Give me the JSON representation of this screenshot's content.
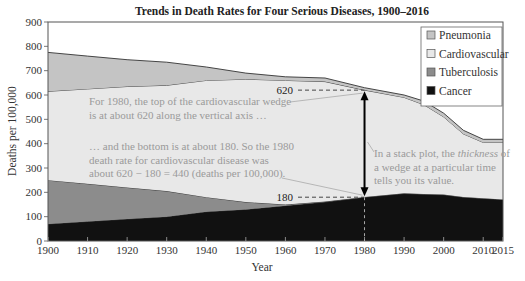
{
  "chart_data": {
    "type": "area",
    "stacked": true,
    "title": "Trends in Death Rates for Four Serious Diseases, 1900–2016",
    "xlabel": "Year",
    "ylabel": "Deaths per 100,000",
    "xlim": [
      1900,
      2015
    ],
    "ylim": [
      0,
      900
    ],
    "x_ticks": [
      "1900",
      "1910",
      "1920",
      "1930",
      "1940",
      "1950",
      "1960",
      "1970",
      "1980",
      "1990",
      "2000",
      "2010",
      "2015"
    ],
    "y_ticks": [
      "0",
      "100",
      "200",
      "300",
      "400",
      "500",
      "600",
      "700",
      "800",
      "900"
    ],
    "grid": false,
    "legend_position": "top-right",
    "x": [
      1900,
      1910,
      1920,
      1930,
      1940,
      1950,
      1960,
      1970,
      1980,
      1990,
      1995,
      2000,
      2005,
      2010,
      2015
    ],
    "cumulative_tops": {
      "Cancer": [
        70,
        80,
        90,
        100,
        120,
        130,
        145,
        160,
        180,
        195,
        192,
        190,
        180,
        175,
        170
      ],
      "Tuberculosis": [
        250,
        235,
        220,
        205,
        180,
        160,
        150,
        162,
        181,
        196,
        193,
        191,
        181,
        176,
        171
      ],
      "Cardiovascular": [
        615,
        625,
        635,
        640,
        660,
        665,
        660,
        655,
        620,
        590,
        560,
        510,
        440,
        405,
        405
      ],
      "Pneumonia": [
        775,
        760,
        745,
        735,
        715,
        690,
        675,
        670,
        630,
        600,
        575,
        525,
        455,
        418,
        418
      ]
    },
    "series": [
      {
        "name": "Cancer",
        "color": "#111111",
        "values": [
          70,
          80,
          90,
          100,
          120,
          130,
          145,
          160,
          180,
          195,
          192,
          190,
          180,
          175,
          170
        ]
      },
      {
        "name": "Tuberculosis",
        "color": "#8c8c8c",
        "values": [
          180,
          155,
          130,
          105,
          60,
          30,
          5,
          2,
          1,
          1,
          1,
          1,
          1,
          1,
          1
        ]
      },
      {
        "name": "Cardiovascular",
        "color": "#e8e8e8",
        "values": [
          365,
          390,
          415,
          435,
          480,
          505,
          510,
          493,
          439,
          394,
          367,
          319,
          259,
          229,
          234
        ]
      },
      {
        "name": "Pneumonia",
        "color": "#c4c4c4",
        "values": [
          160,
          135,
          110,
          95,
          55,
          25,
          15,
          15,
          10,
          10,
          15,
          15,
          15,
          13,
          13
        ]
      }
    ],
    "legend": [
      "Pneumonia",
      "Cardiovascular",
      "Tuberculosis",
      "Cancer"
    ],
    "annotations": {
      "top_marker": {
        "label": "620",
        "x": 1980,
        "y": 620
      },
      "bottom_marker": {
        "label": "180",
        "x": 1980,
        "y": 180
      },
      "note_top": [
        "For 1980, the top of the cardiovascular wedge",
        "is at about 620 along the vertical axis …"
      ],
      "note_bottom": [
        "… and the bottom is at about 180. So the 1980",
        "death rate for cardiovascular disease was",
        "about 620 − 180 = 440 (deaths per 100,000)."
      ],
      "note_right": [
        "In a stack plot, the ",
        "thickness",
        " of",
        "a wedge at a particular time",
        "tells you its value."
      ]
    }
  }
}
